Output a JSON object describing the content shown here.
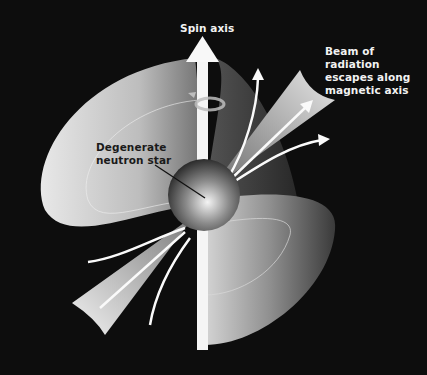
{
  "diagram": {
    "labels": {
      "spin_axis": "Spin axis",
      "beam": [
        "Beam of radiation",
        "escapes along",
        "magnetic axis"
      ],
      "star": [
        "Degenerate",
        "neutron star"
      ]
    },
    "elements": [
      "spin-axis-arrow",
      "rotation-arrow",
      "magnetic-field-lobes",
      "radiation-beam-cones",
      "field-line-arrows",
      "neutron-star-sphere",
      "leader-line"
    ],
    "colors": {
      "background": "#0d0d0d",
      "lobe_light": "#d9d9d9",
      "lobe_dark": "#4a4a4a",
      "axis": "#f5f5f5",
      "text_light": "#f2f2f2",
      "text_dark": "#1a1a1a"
    }
  }
}
